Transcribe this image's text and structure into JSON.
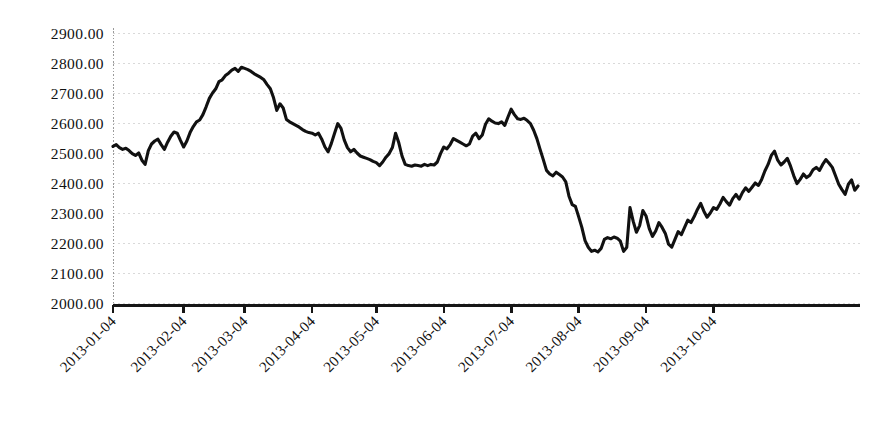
{
  "chart_data": {
    "type": "line",
    "title": "",
    "subtitle": "",
    "xlabel": "",
    "ylabel": "",
    "grid": true,
    "legend": null,
    "ylim": [
      2000.0,
      2900.0
    ],
    "ytick_step": 100.0,
    "ytick_labels": [
      "2900.00",
      "2800.00",
      "2700.00",
      "2600.00",
      "2500.00",
      "2400.00",
      "2300.00",
      "2200.00",
      "2100.00",
      "2000.00"
    ],
    "ytick_values": [
      2900.0,
      2800.0,
      2700.0,
      2600.0,
      2500.0,
      2400.0,
      2300.0,
      2200.0,
      2100.0,
      2000.0
    ],
    "xtick_labels": [
      "2013-01-04",
      "2013-02-04",
      "2013-03-04",
      "2013-04-04",
      "2013-05-04",
      "2013-06-04",
      "2013-07-04",
      "2013-08-04",
      "2013-09-04",
      "2013-10-04"
    ],
    "xtick_indices": [
      0,
      22,
      41,
      62,
      82,
      103,
      124,
      145,
      166,
      187
    ],
    "xtick_rotation_deg": 45,
    "series": [
      {
        "name": "index",
        "color": "#111111",
        "line_width": 3,
        "values": [
          2522,
          2528,
          2518,
          2512,
          2516,
          2508,
          2498,
          2492,
          2500,
          2476,
          2462,
          2508,
          2530,
          2540,
          2546,
          2528,
          2512,
          2536,
          2556,
          2570,
          2566,
          2542,
          2520,
          2540,
          2568,
          2588,
          2604,
          2610,
          2628,
          2654,
          2682,
          2700,
          2714,
          2738,
          2744,
          2758,
          2766,
          2776,
          2782,
          2772,
          2786,
          2782,
          2778,
          2772,
          2764,
          2758,
          2752,
          2744,
          2728,
          2714,
          2684,
          2642,
          2664,
          2650,
          2612,
          2604,
          2598,
          2592,
          2586,
          2578,
          2572,
          2568,
          2566,
          2560,
          2566,
          2546,
          2520,
          2504,
          2532,
          2566,
          2598,
          2582,
          2544,
          2518,
          2504,
          2512,
          2500,
          2490,
          2486,
          2482,
          2478,
          2472,
          2468,
          2458,
          2470,
          2486,
          2498,
          2518,
          2566,
          2534,
          2490,
          2462,
          2458,
          2456,
          2460,
          2458,
          2456,
          2462,
          2458,
          2462,
          2460,
          2470,
          2498,
          2520,
          2514,
          2528,
          2548,
          2542,
          2536,
          2530,
          2524,
          2530,
          2556,
          2566,
          2548,
          2560,
          2596,
          2614,
          2606,
          2600,
          2598,
          2604,
          2592,
          2620,
          2646,
          2628,
          2614,
          2612,
          2616,
          2608,
          2598,
          2576,
          2548,
          2512,
          2478,
          2442,
          2430,
          2424,
          2436,
          2428,
          2420,
          2404,
          2356,
          2328,
          2322,
          2288,
          2252,
          2208,
          2186,
          2172,
          2176,
          2170,
          2182,
          2212,
          2218,
          2214,
          2220,
          2216,
          2206,
          2172,
          2186,
          2318,
          2272,
          2236,
          2258,
          2308,
          2290,
          2248,
          2222,
          2240,
          2268,
          2252,
          2232,
          2196,
          2186,
          2212,
          2238,
          2228,
          2252,
          2276,
          2268,
          2288,
          2312,
          2332,
          2306,
          2286,
          2300,
          2318,
          2312,
          2330,
          2352,
          2338,
          2326,
          2348,
          2362,
          2346,
          2368,
          2384,
          2372,
          2386,
          2400,
          2392,
          2412,
          2440,
          2462,
          2492,
          2506,
          2476,
          2460,
          2470,
          2482,
          2456,
          2424,
          2398,
          2412,
          2430,
          2418,
          2426,
          2444,
          2452,
          2442,
          2462,
          2478,
          2466,
          2452,
          2424,
          2396,
          2378,
          2362,
          2396,
          2410,
          2376,
          2390
        ]
      }
    ],
    "series_min": 2170,
    "series_max": 2786,
    "series_first": 2522,
    "series_last": 2390,
    "n_points": 233
  },
  "axes": {
    "y_axis_style": "dotted-gray",
    "x_axis_style": "solid-black",
    "background_color": "#ffffff",
    "gridline_color": "#d9d9d9",
    "line_color": "#111111"
  }
}
